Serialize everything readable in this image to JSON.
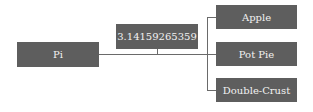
{
  "diagram": {
    "type": "tree",
    "root": {
      "label": "Pi"
    },
    "middle": {
      "label": "3.14159265359"
    },
    "leaves": [
      {
        "label": "Apple"
      },
      {
        "label": "Pot Pie"
      },
      {
        "label": "Double-Crust"
      }
    ],
    "colors": {
      "node_fill": "#5e5e5e",
      "node_text": "#f2f2f2",
      "connector": "#6a6a6a"
    }
  }
}
